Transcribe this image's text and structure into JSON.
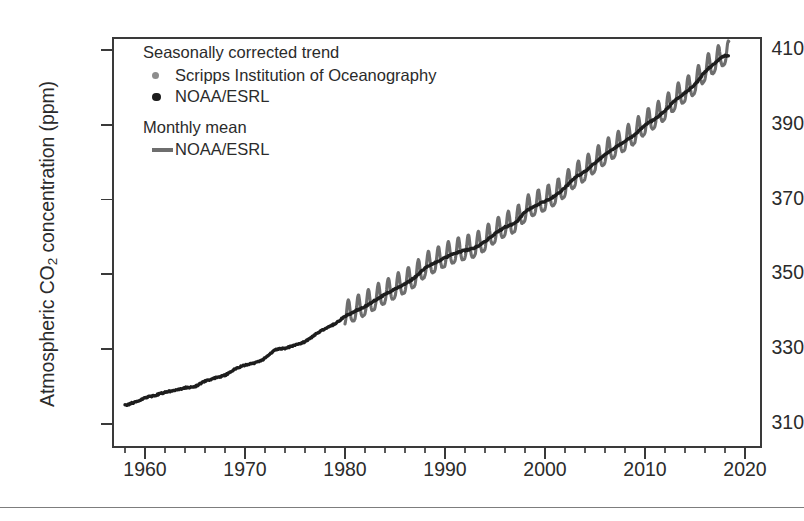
{
  "figure": {
    "background": "#ffffff",
    "axis_color": "#3a3a3a",
    "page_rule_color": "#7d7d7d"
  },
  "axes": {
    "ylabel_text": "Atmospheric CO",
    "ylabel_sub": "2",
    "ylabel_tail": " concentration (ppm)",
    "ylabel_full": "Atmospheric CO2 concentration (ppm)",
    "yticks": [
      310,
      330,
      350,
      370,
      390,
      410
    ],
    "ytick_labels": [
      "310",
      "330",
      "350",
      "370",
      "390",
      "410"
    ],
    "xticks": [
      1960,
      1970,
      1980,
      1990,
      2000,
      2010,
      2020
    ],
    "xtick_labels": [
      "1960",
      "1970",
      "1980",
      "1990",
      "2000",
      "2010",
      "2020"
    ],
    "xminor_step": 2,
    "ylim": [
      303.5,
      413.5
    ],
    "xlim": [
      1956.7,
      2021.7
    ]
  },
  "legend": {
    "groups": [
      {
        "heading": "Seasonally corrected trend",
        "entries": [
          {
            "label": "Scripps Institution of Oceanography",
            "marker": "dot",
            "color": "#8d8d8d"
          },
          {
            "label": "NOAA/ESRL",
            "marker": "dot",
            "color": "#1d1d1d"
          }
        ]
      },
      {
        "heading": "Monthly mean",
        "entries": [
          {
            "label": "NOAA/ESRL",
            "marker": "line",
            "color": "#6e6e6e"
          }
        ]
      }
    ]
  },
  "chart_data": {
    "type": "line",
    "title": "",
    "xlabel": "",
    "ylabel": "Atmospheric CO2 concentration (ppm)",
    "xlim": [
      1956.7,
      2021.7
    ],
    "ylim": [
      303.5,
      413.5
    ],
    "grid": false,
    "legend_position": "upper left",
    "annotations": [],
    "series": [
      {
        "name": "Seasonally corrected trend (Scripps Institution of Oceanography / NOAA/ESRL)",
        "style": "markers",
        "color": "#1d1d1d",
        "note": "Dark trend curve; Scripps markers dominate 1958-1980, NOAA/ESRL markers thereafter, overlapping the monthly mean band.",
        "x": [
          1958,
          1959,
          1960,
          1961,
          1962,
          1963,
          1964,
          1965,
          1966,
          1967,
          1968,
          1969,
          1970,
          1971,
          1972,
          1973,
          1974,
          1975,
          1976,
          1977,
          1978,
          1979,
          1980,
          1981,
          1982,
          1983,
          1984,
          1985,
          1986,
          1987,
          1988,
          1989,
          1990,
          1991,
          1992,
          1993,
          1994,
          1995,
          1996,
          1997,
          1998,
          1999,
          2000,
          2001,
          2002,
          2003,
          2004,
          2005,
          2006,
          2007,
          2008,
          2009,
          2010,
          2011,
          2012,
          2013,
          2014,
          2015,
          2016,
          2017,
          2018
        ],
        "y": [
          315.0,
          315.8,
          316.9,
          317.6,
          318.4,
          319.0,
          319.6,
          320.0,
          321.4,
          322.2,
          323.0,
          324.6,
          325.7,
          326.3,
          327.5,
          329.7,
          330.2,
          331.1,
          332.0,
          333.8,
          335.4,
          336.8,
          338.7,
          340.1,
          341.4,
          343.0,
          344.6,
          346.0,
          347.4,
          349.2,
          351.6,
          353.1,
          354.4,
          355.6,
          356.4,
          357.1,
          358.8,
          360.8,
          362.6,
          363.7,
          366.6,
          368.3,
          369.5,
          371.0,
          373.2,
          375.8,
          377.5,
          379.8,
          381.9,
          383.8,
          385.6,
          387.4,
          389.9,
          391.6,
          393.8,
          396.5,
          398.6,
          400.8,
          404.2,
          406.5,
          408.5
        ]
      },
      {
        "name": "Monthly mean (NOAA/ESRL)",
        "style": "line",
        "color": "#6e6e6e",
        "note": "Oscillating monthly mean with seasonal cycle of roughly 6 ppm peak-to-trough; drawn from 1980 onward over the trend.",
        "start_year": 1980,
        "end_year": 2018.4,
        "seasonal_amplitude_ppm": 3.1,
        "peak_month": 5,
        "trough_month": 9
      }
    ],
    "summary": {
      "start_value_ppm": 315.0,
      "end_value_ppm": 408.5,
      "start_year": 1958,
      "end_year": 2018,
      "total_increase_ppm": 93.5
    }
  }
}
